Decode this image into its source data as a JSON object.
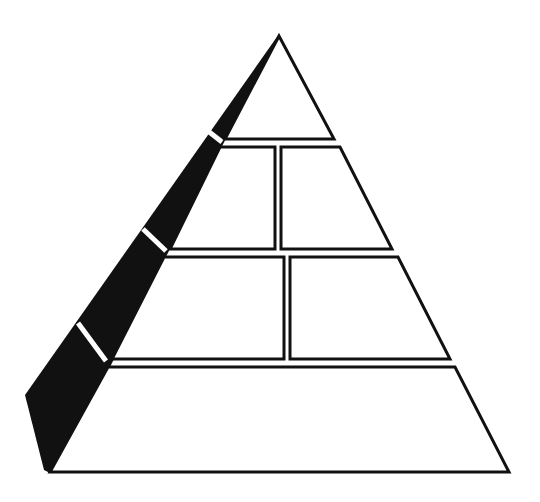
{
  "diagram": {
    "type": "food-pyramid-template",
    "colors": {
      "outline": "#111111",
      "fill": "#ffffff",
      "shadow": "#111111",
      "background": "#ffffff"
    },
    "tiers": [
      {
        "level": 1,
        "name": "top",
        "sections": 1,
        "labels": [
          ""
        ]
      },
      {
        "level": 2,
        "name": "upper-middle",
        "sections": 2,
        "labels": [
          "",
          ""
        ]
      },
      {
        "level": 3,
        "name": "lower-middle",
        "sections": 2,
        "labels": [
          "",
          ""
        ]
      },
      {
        "level": 4,
        "name": "base",
        "sections": 1,
        "labels": [
          ""
        ]
      }
    ],
    "shadow_side": "left"
  }
}
